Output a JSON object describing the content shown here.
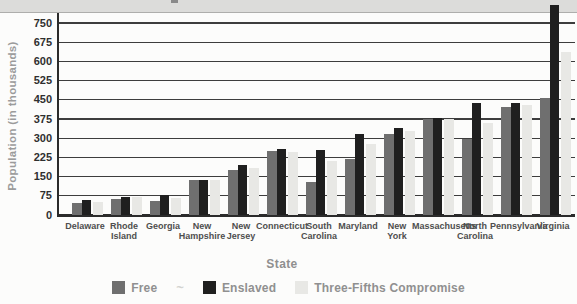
{
  "page": {
    "top_band_color": "#dcdcda",
    "plot_background": "#fcfcfb",
    "gridline_color": "#3d3d3d",
    "axis_color": "#2b2b2b",
    "tick_text_color": "#2f2f2f",
    "axis_title_color": "#9b9b9b",
    "state_label_color": "#4e4e4e"
  },
  "chart_data": {
    "type": "bar",
    "title": "",
    "xlabel": "State",
    "ylabel": "Population (in thousands)",
    "categories": [
      "Delaware",
      "Rhode Island",
      "Georgia",
      "New Hampshire",
      "New Jersey",
      "Connecticut",
      "South Carolina",
      "Maryland",
      "New York",
      "Massachusetts",
      "North Carolina",
      "Pennsylvania",
      "Virginia"
    ],
    "series": [
      {
        "name": "Free",
        "color": "#6f6f6f",
        "values": [
          48,
          63,
          53,
          135,
          177,
          250,
          130,
          218,
          315,
          375,
          298,
          422,
          458
        ]
      },
      {
        "name": "Enslaved",
        "color": "#1f1f1f",
        "values": [
          60,
          69,
          78,
          137,
          196,
          258,
          255,
          315,
          340,
          378,
          436,
          436,
          750
        ]
      },
      {
        "name": "Three-Fifths Compromise",
        "color": "#e8e8e5",
        "values": [
          52,
          71,
          68,
          135,
          185,
          248,
          210,
          278,
          330,
          375,
          360,
          428,
          635
        ]
      }
    ],
    "ylim": [
      0,
      750
    ],
    "ytick_step": 75,
    "yticks": [
      0,
      75,
      150,
      225,
      300,
      375,
      450,
      525,
      600,
      675,
      750
    ],
    "grid": "horizontal",
    "legend_position": "bottom",
    "legend_separator_glyph": "~",
    "layout_hints": {
      "overflow_bar": {
        "category": "Virginia",
        "series": "Enslaved"
      },
      "title_cropped_off_top": true
    }
  }
}
